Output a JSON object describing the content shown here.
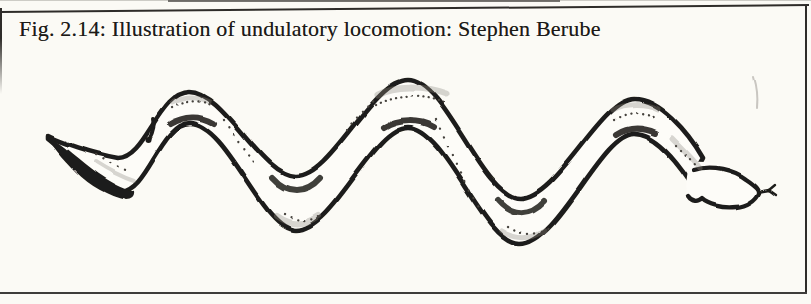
{
  "figure": {
    "caption": "Fig. 2.14: Illustration of undulatory locomotion: Stephen Berube",
    "figure_number": "2.14",
    "subject": "undulatory locomotion",
    "credit": "Stephen Berube",
    "illustration": "hand-drawn snake moving in a serpentine S-curve, tail at left, head with forked tongue at right"
  },
  "colors": {
    "paper": "#fbfaf5",
    "ink": "#1f1d1a",
    "body": "#fdfcf8",
    "shade": "#8d8a84",
    "dots": "#45423d",
    "border": "#2e2c29"
  }
}
